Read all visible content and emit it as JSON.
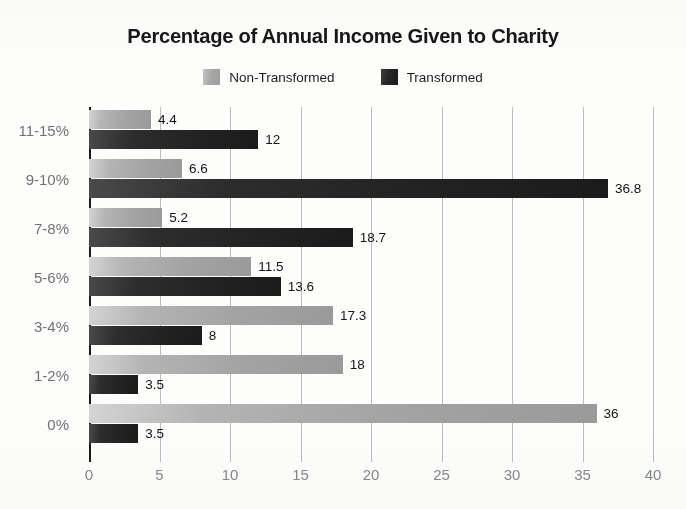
{
  "chart_data": {
    "type": "bar",
    "orientation": "horizontal",
    "title": "Percentage of Annual Income Given to Charity",
    "xlabel": "",
    "ylabel": "",
    "xlim": [
      0,
      40
    ],
    "xticks": [
      "0",
      "5",
      "10",
      "15",
      "20",
      "25",
      "30",
      "35",
      "40"
    ],
    "grid": true,
    "legend_position": "top-center",
    "categories": [
      "11-15%",
      "9-10%",
      "7-8%",
      "5-6%",
      "3-4%",
      "1-2%",
      "0%"
    ],
    "series": [
      {
        "name": "Non-Transformed",
        "color": "#a9a9a9",
        "values": [
          4.4,
          6.6,
          5.2,
          11.5,
          17.3,
          18,
          36
        ],
        "labels": [
          "4.4",
          "6.6",
          "5.2",
          "11.5",
          "17.3",
          "18",
          "36"
        ]
      },
      {
        "name": "Transformed",
        "color": "#262626",
        "values": [
          12,
          36.8,
          18.7,
          13.6,
          8,
          3.5,
          3.5
        ],
        "labels": [
          "12",
          "36.8",
          "18.7",
          "13.6",
          "8",
          "3.5",
          "3.5"
        ]
      }
    ]
  },
  "colors": {
    "background": "#fdfdfb",
    "axis": "#1a1a1a",
    "gridline": "#b9bcc0",
    "tick_label": "#85888d",
    "category_label": "#6f7277",
    "value_label": "#141417",
    "title": "#17171a",
    "series_light": "#a9a9a9",
    "series_dark": "#262626"
  }
}
